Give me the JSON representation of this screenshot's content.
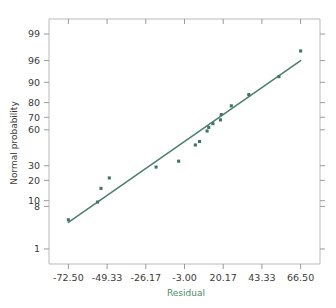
{
  "chart_data": {
    "type": "scatter",
    "title": "",
    "xlabel": "Residual",
    "ylabel": "Normal probability",
    "grid": false,
    "legend": "none",
    "y_scale": "normal-probability",
    "x_ticks": [
      "-72.50",
      "-49.33",
      "-26.17",
      "-3.00",
      "20.17",
      "43.33",
      "66.50"
    ],
    "x_tick_values": [
      -72.5,
      -49.33,
      -26.17,
      -3.0,
      20.17,
      43.33,
      66.5
    ],
    "y_ticks": [
      "99",
      "96",
      "90",
      "80",
      "70",
      "60",
      "30",
      "20",
      "10",
      "8",
      "1"
    ],
    "y_tick_values": [
      99,
      96,
      90,
      80,
      70,
      60,
      30,
      20,
      10,
      8,
      1
    ],
    "xlim": [
      -84.1,
      78.1
    ],
    "ylim": [
      0.4,
      99.6
    ],
    "points": [
      {
        "x": -72.5,
        "y": 4.5
      },
      {
        "x": -55.0,
        "y": 9.5
      },
      {
        "x": -53.0,
        "y": 15.5
      },
      {
        "x": -48.0,
        "y": 21.5
      },
      {
        "x": -20.0,
        "y": 29.0
      },
      {
        "x": -6.5,
        "y": 33.5
      },
      {
        "x": 3.5,
        "y": 47.0
      },
      {
        "x": 6.0,
        "y": 50.0
      },
      {
        "x": 10.5,
        "y": 59.0
      },
      {
        "x": 11.5,
        "y": 62.0
      },
      {
        "x": 14.0,
        "y": 65.0
      },
      {
        "x": 18.5,
        "y": 68.0
      },
      {
        "x": 19.0,
        "y": 72.0
      },
      {
        "x": 25.0,
        "y": 78.0
      },
      {
        "x": 35.5,
        "y": 84.5
      },
      {
        "x": 53.5,
        "y": 92.0
      },
      {
        "x": 66.5,
        "y": 97.5
      }
    ],
    "fit_line": {
      "x_start": -72.5,
      "y_start": 4.0,
      "x_end": 66.5,
      "y_end": 96.0
    },
    "colors": {
      "marker": "#3f7568",
      "line": "#4d7f73",
      "xlabel": "#4b8c63",
      "ylabel": "#3a3a3a",
      "axis": "#b9b9b9",
      "background": "#ffffff"
    }
  }
}
